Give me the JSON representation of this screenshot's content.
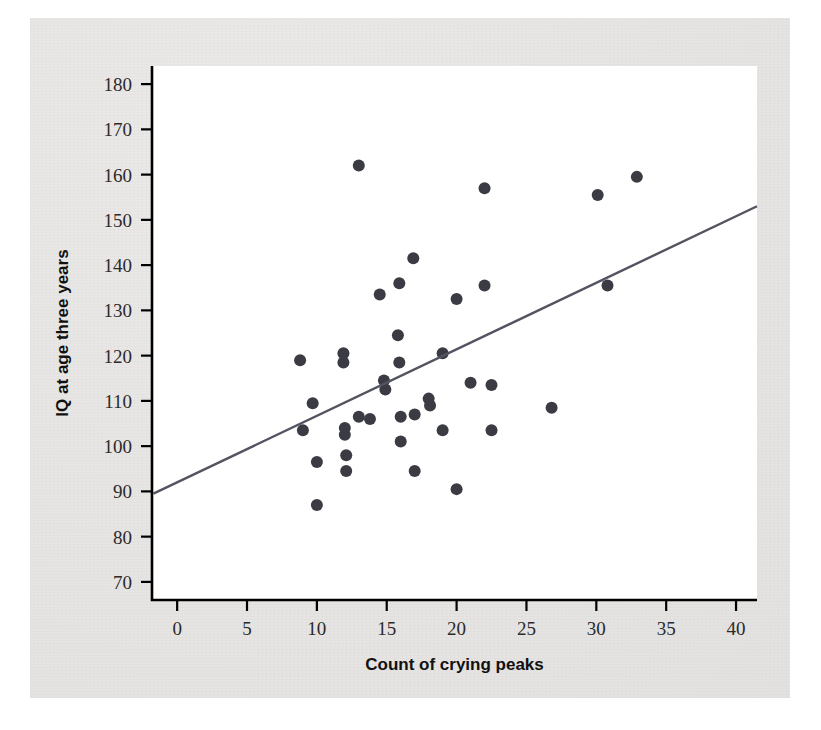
{
  "figure": {
    "background_color": "#e8e6e4",
    "plot_background_color": "#ffffff"
  },
  "chart_data": {
    "type": "scatter",
    "title": "",
    "xlabel": "Count of crying peaks",
    "ylabel": "IQ at age three years",
    "xlim": [
      -1.8,
      41.5
    ],
    "ylim": [
      66,
      184
    ],
    "xticks": [
      0,
      5,
      10,
      15,
      20,
      25,
      30,
      35,
      40
    ],
    "xtick_labels": [
      "0",
      "5",
      "10",
      "15",
      "20",
      "25",
      "30",
      "35",
      "40"
    ],
    "yticks": [
      70,
      80,
      90,
      100,
      110,
      120,
      130,
      140,
      150,
      160,
      170,
      180
    ],
    "ytick_labels": [
      "70",
      "80",
      "90",
      "100",
      "110",
      "120",
      "130",
      "140",
      "150",
      "160",
      "170",
      "180"
    ],
    "grid": false,
    "legend": null,
    "marker_color": "#3b3b43",
    "marker_size": 6,
    "points": [
      {
        "x": 8.8,
        "y": 119.0
      },
      {
        "x": 9.0,
        "y": 103.5
      },
      {
        "x": 9.7,
        "y": 109.5
      },
      {
        "x": 10.0,
        "y": 96.5
      },
      {
        "x": 10.0,
        "y": 87.0
      },
      {
        "x": 11.9,
        "y": 120.5
      },
      {
        "x": 11.9,
        "y": 118.5
      },
      {
        "x": 12.0,
        "y": 104.0
      },
      {
        "x": 12.0,
        "y": 102.5
      },
      {
        "x": 12.1,
        "y": 98.0
      },
      {
        "x": 12.1,
        "y": 94.5
      },
      {
        "x": 13.0,
        "y": 162.0
      },
      {
        "x": 13.0,
        "y": 106.5
      },
      {
        "x": 13.8,
        "y": 106.0
      },
      {
        "x": 14.5,
        "y": 133.5
      },
      {
        "x": 14.8,
        "y": 114.5
      },
      {
        "x": 14.9,
        "y": 112.5
      },
      {
        "x": 15.9,
        "y": 136.0
      },
      {
        "x": 15.8,
        "y": 124.5
      },
      {
        "x": 15.9,
        "y": 118.5
      },
      {
        "x": 16.0,
        "y": 106.5
      },
      {
        "x": 16.0,
        "y": 101.0
      },
      {
        "x": 16.9,
        "y": 141.5
      },
      {
        "x": 17.0,
        "y": 107.0
      },
      {
        "x": 17.0,
        "y": 94.5
      },
      {
        "x": 18.0,
        "y": 110.5
      },
      {
        "x": 18.1,
        "y": 109.0
      },
      {
        "x": 19.0,
        "y": 120.5
      },
      {
        "x": 19.0,
        "y": 103.5
      },
      {
        "x": 20.0,
        "y": 132.5
      },
      {
        "x": 20.0,
        "y": 90.5
      },
      {
        "x": 21.0,
        "y": 114.0
      },
      {
        "x": 22.0,
        "y": 157.0
      },
      {
        "x": 22.0,
        "y": 135.5
      },
      {
        "x": 22.5,
        "y": 113.5
      },
      {
        "x": 22.5,
        "y": 103.5
      },
      {
        "x": 26.8,
        "y": 108.5
      },
      {
        "x": 30.1,
        "y": 155.5
      },
      {
        "x": 30.8,
        "y": 135.5
      },
      {
        "x": 32.9,
        "y": 159.5
      }
    ],
    "fit_line": {
      "kind": "linear-regression",
      "x_start": -1.7,
      "y_start": 89.5,
      "x_end": 41.5,
      "y_end": 153.0,
      "color": "#545460"
    }
  }
}
